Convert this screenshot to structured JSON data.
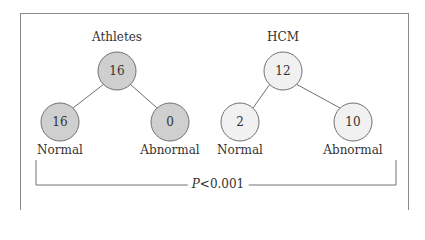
{
  "colors": {
    "athletes_fill": "#cfcfcf",
    "hcm_fill": "#f1f1f1",
    "stroke": "#707070",
    "frame": "#8a8a8a"
  },
  "groups": [
    {
      "title": "Athletes",
      "total": "16",
      "normal": "16",
      "abnormal": "0",
      "normal_label": "Normal",
      "abnormal_label": "Abnormal"
    },
    {
      "title": "HCM",
      "total": "12",
      "normal": "2",
      "abnormal": "10",
      "normal_label": "Normal",
      "abnormal_label": "Abnormal"
    }
  ],
  "comparison": {
    "p_symbol": "P",
    "p_text": "<0.001"
  }
}
